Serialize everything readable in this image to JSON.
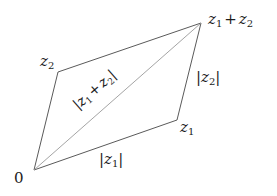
{
  "diagram": {
    "points": {
      "origin": {
        "label": "0",
        "x": 34,
        "y": 170
      },
      "z1": {
        "label": "z",
        "sub": "1",
        "x": 177,
        "y": 120
      },
      "z2": {
        "label": "z",
        "sub": "2",
        "x": 58,
        "y": 72
      },
      "sum": {
        "label_a": "z",
        "sub_a": "1",
        "plus": "+",
        "label_b": "z",
        "sub_b": "2",
        "x": 201,
        "y": 23
      }
    },
    "edge_labels": {
      "z1_mod": {
        "open": "|",
        "var": "z",
        "sub": "1",
        "close": "|"
      },
      "z2_mod": {
        "open": "|",
        "var": "z",
        "sub": "2",
        "close": "|"
      },
      "sum_mod": {
        "open": "|",
        "var_a": "z",
        "sub_a": "1",
        "plus": "+",
        "var_b": "z",
        "sub_b": "2",
        "close": "|"
      }
    },
    "colors": {
      "edge": "#5a5a5a",
      "diagonal": "#9a9a9a",
      "text": "#1c1c1c"
    }
  }
}
